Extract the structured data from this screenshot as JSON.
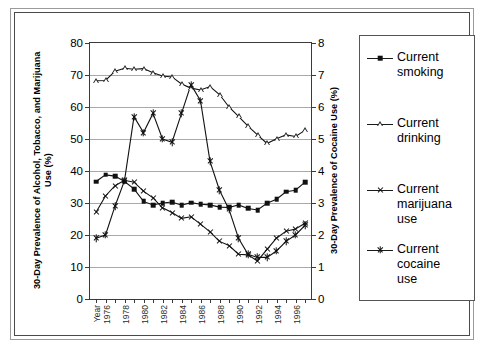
{
  "chart_data": {
    "type": "line",
    "title": "",
    "xlabel": "Year",
    "ylabel": "30-Day Prevalence of Alcohol, Tobacco, and Marijuana Use (%)",
    "y2label": "30-Day Prevalence of Cocaine Use (%)",
    "ylim": [
      0,
      80
    ],
    "y2lim": [
      0,
      8
    ],
    "ytick_labels": [
      "0",
      "10",
      "20",
      "30",
      "40",
      "50",
      "60",
      "70",
      "80"
    ],
    "y2tick_labels": [
      "0",
      "1",
      "2",
      "3",
      "4",
      "5",
      "6",
      "7",
      "8"
    ],
    "grid": true,
    "legend_position": "right",
    "x": [
      1975,
      1976,
      1977,
      1978,
      1979,
      1980,
      1981,
      1982,
      1983,
      1984,
      1985,
      1986,
      1987,
      1988,
      1989,
      1990,
      1991,
      1992,
      1993,
      1994,
      1995,
      1996,
      1997
    ],
    "xtick_labels": [
      "Year",
      "1976",
      "1978",
      "1980",
      "1982",
      "1984",
      "1986",
      "1988",
      "1990",
      "1992",
      "1994",
      "1996"
    ],
    "series": [
      {
        "name": "Current smoking",
        "marker": "filled-square",
        "axis": "left",
        "values": [
          36.7,
          38.8,
          38.4,
          36.7,
          34.4,
          30.5,
          29.4,
          30.0,
          30.3,
          29.3,
          30.1,
          29.6,
          29.4,
          28.7,
          28.6,
          29.4,
          28.3,
          27.8,
          29.9,
          31.2,
          33.5,
          34.0,
          36.5
        ]
      },
      {
        "name": "Current drinking",
        "marker": "open-triangle",
        "axis": "left",
        "values": [
          68.2,
          68.3,
          71.2,
          72.1,
          71.8,
          72.0,
          70.7,
          69.7,
          69.4,
          67.2,
          65.9,
          65.3,
          66.4,
          63.9,
          60.0,
          57.1,
          54.0,
          51.3,
          48.6,
          50.1,
          51.3,
          50.8,
          52.7
        ]
      },
      {
        "name": "Current marijuana use",
        "marker": "x",
        "axis": "left",
        "values": [
          27.1,
          32.2,
          35.4,
          37.1,
          36.5,
          33.7,
          31.6,
          28.5,
          27.0,
          25.2,
          25.7,
          23.4,
          21.0,
          18.0,
          16.7,
          14.0,
          13.8,
          11.9,
          15.5,
          19.0,
          21.2,
          21.9,
          23.7
        ]
      },
      {
        "name": "Current cocaine use",
        "marker": "star",
        "axis": "right",
        "values": [
          1.9,
          2.0,
          2.9,
          3.7,
          5.7,
          5.2,
          5.8,
          5.0,
          4.9,
          5.8,
          6.7,
          6.2,
          4.3,
          3.4,
          2.8,
          1.9,
          1.4,
          1.3,
          1.3,
          1.5,
          1.8,
          2.0,
          2.3
        ]
      }
    ]
  },
  "axes": {
    "left_title": "30-Day Prevalence of Alcohol, Tobacco,\nand Marijuana Use (%)",
    "right_title": "30-Day Prevalence of Cocaine Use (%)"
  },
  "legend": {
    "items": [
      {
        "label": "Current\nsmoking",
        "marker": "filled-square-marker"
      },
      {
        "label": "Current\ndrinking",
        "marker": "open-triangle-marker"
      },
      {
        "label": "Current\nmarijuana\nuse",
        "marker": "x-marker"
      },
      {
        "label": "Current\ncocaine\nuse",
        "marker": "star-marker"
      }
    ]
  },
  "colors": {
    "line": "#111111",
    "grid": "#a9a9a9",
    "axis": "#3a3a3a",
    "frame_outer": "#9a9a9a",
    "frame_inner": "#4a4a4a",
    "background": "#ffffff"
  }
}
